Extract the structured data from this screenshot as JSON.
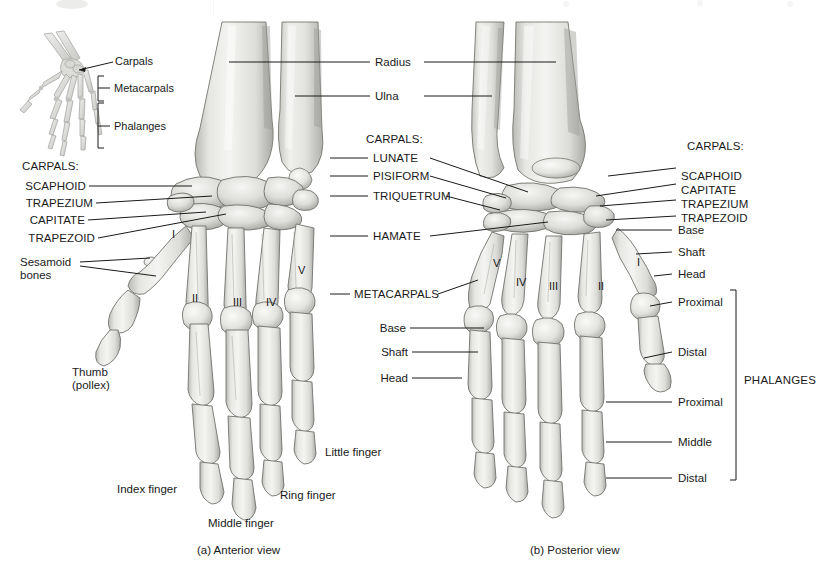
{
  "figure": {
    "title_visible": false,
    "background": "#ffffff",
    "bone_fill": "#e9e9e6",
    "bone_shadow": "#9a9a97",
    "bone_outline": "#6e6e6b",
    "leader_color": "#1a1a1a",
    "text_color": "#1a1a1a"
  },
  "inset": {
    "name": "hand-orientation-inset",
    "labels": {
      "carpals": "Carpals",
      "metacarpals": "Metacarpals",
      "phalanges": "Phalanges"
    }
  },
  "panels": [
    {
      "id": "a",
      "caption": "(a) Anterior view"
    },
    {
      "id": "b",
      "caption": "(b) Posterior view"
    }
  ],
  "forearm": {
    "radius": "Radius",
    "ulna": "Ulna"
  },
  "anterior": {
    "carpals_heading": "CARPALS:",
    "carpals": [
      "SCAPHOID",
      "TRAPEZIUM",
      "CAPITATE",
      "TRAPEZOID"
    ],
    "sesamoid_line1": "Sesamoid",
    "sesamoid_line2": "bones",
    "thumb_line1": "Thumb",
    "thumb_line2": "(pollex)",
    "metacarpal_numerals": [
      "I",
      "II",
      "III",
      "IV",
      "V"
    ],
    "fingers": [
      "Index finger",
      "Middle finger",
      "Ring finger",
      "Little finger"
    ]
  },
  "center": {
    "carpals_heading": "CARPALS:",
    "carpals": [
      "LUNATE",
      "PISIFORM",
      "TRIQUETRUM",
      "HAMATE"
    ],
    "metacarpals": "METACARPALS",
    "metacarpal_parts": [
      "Base",
      "Shaft",
      "Head"
    ]
  },
  "posterior": {
    "carpals_heading": "CARPALS:",
    "carpals": [
      "SCAPHOID",
      "CAPITATE",
      "TRAPEZIUM",
      "TRAPEZOID"
    ],
    "metacarpal_parts": [
      "Base",
      "Shaft",
      "Head"
    ],
    "thumb_phalanges": [
      "Proximal",
      "Distal"
    ],
    "finger_phalanges": [
      "Proximal",
      "Middle",
      "Distal"
    ],
    "phalanges_bracket": "PHALANGES",
    "metacarpal_numerals": [
      "V",
      "IV",
      "III",
      "II",
      "I"
    ]
  }
}
